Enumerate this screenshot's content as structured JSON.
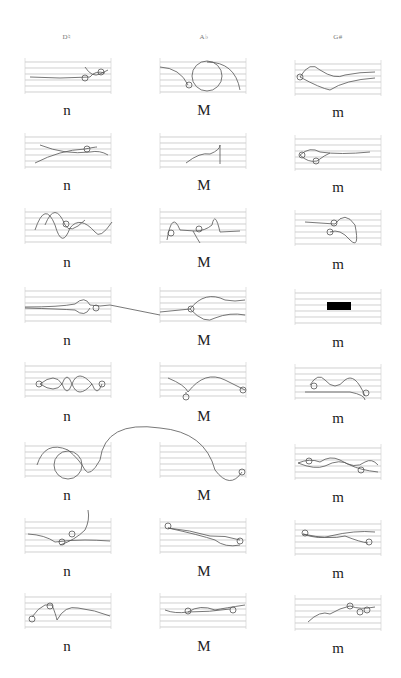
{
  "columns": [
    {
      "header": "D♮",
      "label": "n",
      "x_center": 67
    },
    {
      "header": "A♭",
      "label": "M",
      "x_center": 204
    },
    {
      "header": "G#",
      "label": "m",
      "x_center": 338
    }
  ],
  "rows": 8,
  "staff": {
    "line_count": 6,
    "line_color": "#bbbbbb",
    "stroke_color": "#555555"
  },
  "row_labels": [
    "n",
    "M",
    "m"
  ],
  "accent_fill": "#000000"
}
